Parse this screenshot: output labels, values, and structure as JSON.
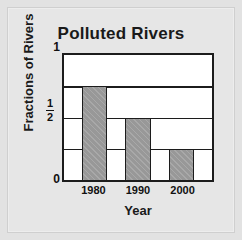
{
  "chart_data": {
    "type": "bar",
    "title": "Polluted Rivers",
    "xlabel": "Year",
    "ylabel": "Fractions of Rivers",
    "categories": [
      "1980",
      "1990",
      "2000"
    ],
    "values": [
      0.75,
      0.5,
      0.25
    ],
    "ylim": [
      0,
      1
    ],
    "yticks": [
      {
        "value": 0,
        "label": "0",
        "is_fraction": false
      },
      {
        "value": 0.5,
        "label": "1/2",
        "is_fraction": true,
        "numerator": "1",
        "denominator": "2"
      },
      {
        "value": 1,
        "label": "1",
        "is_fraction": false
      }
    ],
    "gridlines": [
      0.25,
      0.5,
      0.75
    ],
    "grid": true,
    "legend": null,
    "bar_fill": "#989898",
    "bar_pattern": "diagonal-hatch",
    "axis_color": "#1c1c1c",
    "plot_background": "#ffffff",
    "page_background": "#e6e6e6"
  },
  "bars": [
    {
      "category": "1980",
      "value": 0.75,
      "height_pct": "75%"
    },
    {
      "category": "1990",
      "value": 0.5,
      "height_pct": "50%"
    },
    {
      "category": "2000",
      "value": 0.25,
      "height_pct": "25%"
    }
  ]
}
